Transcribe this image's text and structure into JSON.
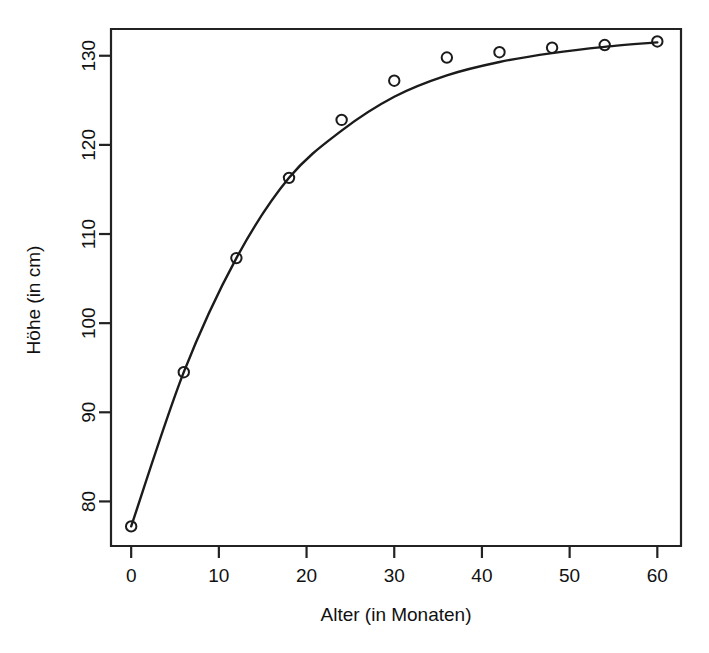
{
  "chart_data": {
    "type": "scatter",
    "title": "",
    "subtitle": "",
    "xlabel": "Alter (in Monaten)",
    "ylabel": "Höhe (in cm)",
    "xlim": [
      -2.3,
      62.7
    ],
    "ylim": [
      75.0,
      133.0
    ],
    "xticks": [
      0,
      10,
      20,
      30,
      40,
      50,
      60
    ],
    "xtick_labels": [
      "0",
      "10",
      "20",
      "30",
      "40",
      "50",
      "60"
    ],
    "yticks": [
      80,
      90,
      100,
      110,
      120,
      130
    ],
    "ytick_labels": [
      "80",
      "90",
      "100",
      "110",
      "120",
      "130"
    ],
    "grid": false,
    "legend": "none",
    "marker": "open-circle",
    "x": [
      0,
      6,
      12,
      18,
      24,
      30,
      36,
      42,
      48,
      54,
      60
    ],
    "values": [
      77.2,
      94.5,
      107.3,
      116.3,
      122.8,
      127.2,
      129.8,
      130.4,
      130.9,
      131.2,
      131.6
    ],
    "series": [
      {
        "name": "Messpunkte",
        "x": [
          0,
          6,
          12,
          18,
          24,
          30,
          36,
          42,
          48,
          54,
          60
        ],
        "values": [
          77.2,
          94.5,
          107.3,
          116.3,
          122.8,
          127.2,
          129.8,
          130.4,
          130.9,
          131.2,
          131.6
        ],
        "style": "points"
      },
      {
        "name": "Angepasste Kurve",
        "x": [
          0,
          6,
          12,
          18,
          24,
          30,
          36,
          42,
          48,
          54,
          60
        ],
        "values": [
          77.2,
          94.5,
          107.3,
          116.3,
          121.6,
          125.4,
          127.8,
          129.3,
          130.3,
          131.0,
          131.5
        ],
        "style": "line"
      }
    ],
    "colors": {
      "line": "#1b1b1b",
      "marker": "#1b1b1b",
      "axis": "#222222",
      "background": "#ffffff"
    }
  }
}
